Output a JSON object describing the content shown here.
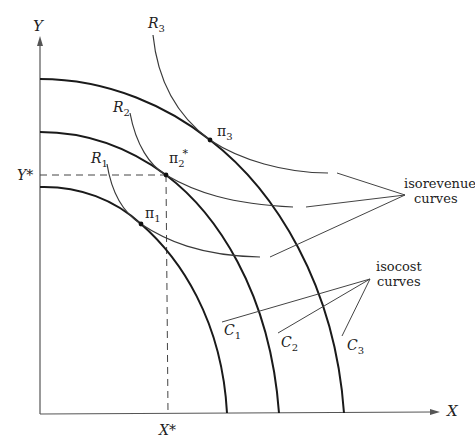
{
  "diagram": {
    "axes": {
      "x_label": "X",
      "y_label": "Y",
      "x_star_label": "X*",
      "y_star_label": "Y*"
    },
    "isocost_curves": [
      {
        "id": "C1",
        "label": "C",
        "sub": "1"
      },
      {
        "id": "C2",
        "label": "C",
        "sub": "2"
      },
      {
        "id": "C3",
        "label": "C",
        "sub": "3"
      }
    ],
    "isorevenue_curves": [
      {
        "id": "R1",
        "label": "R",
        "sub": "1"
      },
      {
        "id": "R2",
        "label": "R",
        "sub": "2"
      },
      {
        "id": "R3",
        "label": "R",
        "sub": "3"
      }
    ],
    "tangency_points": [
      {
        "id": "pi1",
        "label": "π",
        "sub": "1",
        "sup": ""
      },
      {
        "id": "pi2",
        "label": "π",
        "sub": "2",
        "sup": "*"
      },
      {
        "id": "pi3",
        "label": "π",
        "sub": "3",
        "sup": ""
      }
    ],
    "annotations": {
      "isorevenue_line1": "isorevenue",
      "isorevenue_line2": "curves",
      "isocost_line1": "isocost",
      "isocost_line2": "curves"
    }
  }
}
